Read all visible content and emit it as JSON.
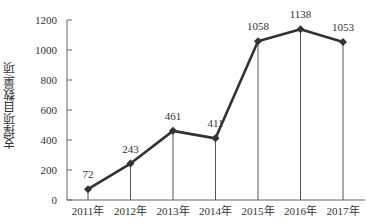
{
  "chart_data": {
    "type": "line",
    "title": "",
    "xlabel": "",
    "ylabel": "支撑项目数量/项",
    "categories": [
      "2011年",
      "2012年",
      "2013年",
      "2014年",
      "2015年",
      "2016年",
      "2017年"
    ],
    "values": [
      72,
      243,
      461,
      411,
      1058,
      1138,
      1053
    ],
    "data_labels": [
      "72",
      "243",
      "461",
      "411",
      "1058",
      "1138",
      "1053"
    ],
    "ylim": [
      0,
      1200
    ],
    "yticks": [
      0,
      200,
      400,
      600,
      800,
      1000,
      1200
    ],
    "ytick_labels": [
      "0",
      "200",
      "400",
      "600",
      "800",
      "1000",
      "1200"
    ],
    "grid": false,
    "drop_lines": true,
    "marker": "diamond",
    "line_color": "#333333",
    "legend": null
  }
}
